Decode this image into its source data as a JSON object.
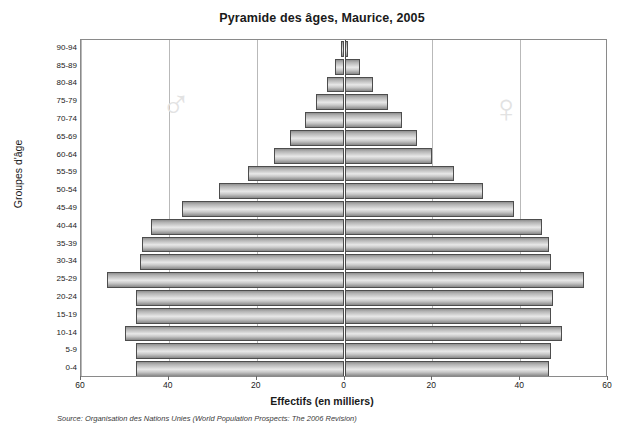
{
  "chart_data": {
    "type": "bar",
    "subtype": "population-pyramid",
    "title": "Pyramide des âges, Maurice, 2005",
    "xlabel": "Effectifs (en milliers)",
    "ylabel": "Groupes d'âge",
    "xlim": [
      -60,
      60
    ],
    "xticks": [
      60,
      40,
      20,
      0,
      20,
      40,
      60
    ],
    "grid": true,
    "grid_axis": "x",
    "legend": false,
    "watermarks": [
      {
        "name": "male-symbol",
        "glyph": "♂",
        "side": "left"
      },
      {
        "name": "female-symbol",
        "glyph": "♀",
        "side": "right"
      }
    ],
    "source": "Source: Organisation des Nations Unies (World Population Prospects: The 2006 Revision)",
    "categories": [
      "90-94",
      "85-89",
      "80-84",
      "75-79",
      "70-74",
      "65-69",
      "60-64",
      "55-59",
      "50-54",
      "45-49",
      "40-44",
      "35-39",
      "30-34",
      "25-29",
      "20-24",
      "15-19",
      "10-14",
      "5-9",
      "0-4"
    ],
    "series": [
      {
        "name": "Hommes",
        "side": "left",
        "values": [
          0.8,
          2.2,
          4.0,
          6.5,
          9.0,
          12.5,
          16.0,
          22.0,
          28.5,
          37.0,
          44.0,
          46.0,
          46.5,
          54.0,
          47.5,
          47.5,
          50.0,
          47.5,
          47.5
        ]
      },
      {
        "name": "Femmes",
        "side": "right",
        "values": [
          0.8,
          3.5,
          6.5,
          10.0,
          13.0,
          16.5,
          20.0,
          25.0,
          31.5,
          38.5,
          45.0,
          46.5,
          47.0,
          54.5,
          47.5,
          47.0,
          49.5,
          47.0,
          46.5
        ]
      }
    ]
  },
  "colors": {
    "bar_edge": "#4d4d4d",
    "bar_fill_light": "#e8e8e8",
    "bar_fill_dark": "#878787",
    "gridline": "#b9b9b9",
    "axis_zero": "#4a4a4a",
    "frame": "#8a8a8a",
    "watermark": "#e2e2e2",
    "text": "#1a1a1a",
    "background": "#ffffff"
  }
}
